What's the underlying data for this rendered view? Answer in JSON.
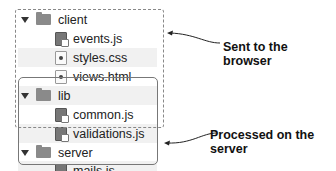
{
  "tree": {
    "folders": [
      {
        "name": "client",
        "files": [
          "events.js",
          "styles.css",
          "views.html"
        ]
      },
      {
        "name": "lib",
        "files": [
          "common.js",
          "validations.js"
        ]
      },
      {
        "name": "server",
        "files": [
          "mails.js"
        ]
      }
    ]
  },
  "rows": [
    {
      "label": "client",
      "type": "folder"
    },
    {
      "label": "events.js",
      "type": "js"
    },
    {
      "label": "styles.css",
      "type": "doc"
    },
    {
      "label": "views.html",
      "type": "doc"
    },
    {
      "label": "lib",
      "type": "folder"
    },
    {
      "label": "common.js",
      "type": "js"
    },
    {
      "label": "validations.js",
      "type": "js"
    },
    {
      "label": "server",
      "type": "folder"
    },
    {
      "label": "mails.js",
      "type": "js"
    }
  ],
  "annotations": {
    "client_side": "Sent to the browser",
    "server_side": "Processed on the server"
  },
  "colors": {
    "dashed_box": "#888888",
    "solid_box": "#777777",
    "folder": "#8a8a8a",
    "stripe": "#f1f1f1"
  }
}
